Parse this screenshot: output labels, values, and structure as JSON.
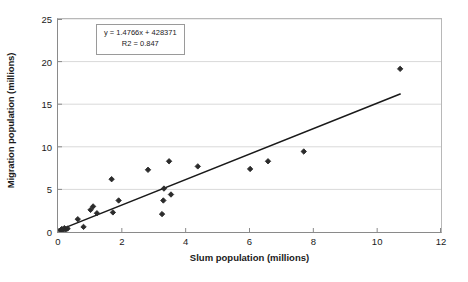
{
  "chart_data": {
    "type": "scatter",
    "title": "",
    "xlabel": "Slum population (millions)",
    "ylabel": "Migration population (millions)",
    "xlim": [
      0,
      12
    ],
    "ylim": [
      0,
      25
    ],
    "xticks": [
      "0",
      "2",
      "4",
      "6",
      "8",
      "10",
      "12"
    ],
    "yticks": [
      "0",
      "5",
      "10",
      "15",
      "20",
      "25"
    ],
    "grid": "horizontal",
    "legend": "none",
    "marker": "diamond",
    "marker_color": "#2b2b2b",
    "trendline_color": "#1a1a1a",
    "annotations": {
      "equation": "y = 1.4766x + 428371",
      "r_squared": "R2 = 0.847"
    },
    "trendline": {
      "type": "linear",
      "x_start": 0.05,
      "y_start": 0.25,
      "x_end": 10.72,
      "y_end": 16.2
    },
    "points": [
      {
        "x": 0.08,
        "y": 0.2
      },
      {
        "x": 0.12,
        "y": 0.35
      },
      {
        "x": 0.16,
        "y": 0.25
      },
      {
        "x": 0.2,
        "y": 0.45
      },
      {
        "x": 0.24,
        "y": 0.3
      },
      {
        "x": 0.3,
        "y": 0.4
      },
      {
        "x": 0.62,
        "y": 1.5
      },
      {
        "x": 0.8,
        "y": 0.6
      },
      {
        "x": 1.02,
        "y": 2.6
      },
      {
        "x": 1.1,
        "y": 3.0
      },
      {
        "x": 1.22,
        "y": 2.2
      },
      {
        "x": 1.68,
        "y": 6.2
      },
      {
        "x": 1.72,
        "y": 2.3
      },
      {
        "x": 1.9,
        "y": 3.7
      },
      {
        "x": 2.82,
        "y": 7.3
      },
      {
        "x": 3.26,
        "y": 2.1
      },
      {
        "x": 3.3,
        "y": 3.7
      },
      {
        "x": 3.32,
        "y": 5.1
      },
      {
        "x": 3.48,
        "y": 8.3
      },
      {
        "x": 3.54,
        "y": 4.4
      },
      {
        "x": 4.38,
        "y": 7.7
      },
      {
        "x": 6.02,
        "y": 7.4
      },
      {
        "x": 6.58,
        "y": 8.3
      },
      {
        "x": 7.7,
        "y": 9.45
      },
      {
        "x": 10.72,
        "y": 19.15
      }
    ]
  }
}
